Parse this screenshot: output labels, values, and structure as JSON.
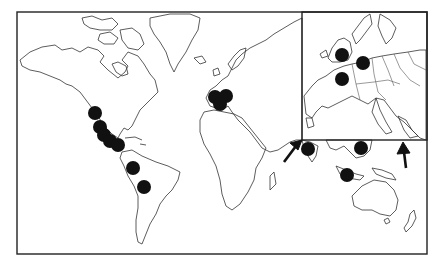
{
  "figure": {
    "type": "world-map-with-inset",
    "colors": {
      "background": "#ffffff",
      "outline": "#333333",
      "markers": "#111111"
    }
  },
  "main_map": {
    "markers": [
      {
        "region": "Mexico (northwest)",
        "x": 95,
        "y": 113
      },
      {
        "region": "Mexico (west)",
        "x": 100,
        "y": 127
      },
      {
        "region": "Mexico (central)",
        "x": 104,
        "y": 135
      },
      {
        "region": "Mexico (south)",
        "x": 110,
        "y": 141
      },
      {
        "region": "Central America",
        "x": 118,
        "y": 145
      },
      {
        "region": "Colombia/Ecuador",
        "x": 133,
        "y": 168
      },
      {
        "region": "Peru/Bolivia",
        "x": 144,
        "y": 187
      },
      {
        "region": "Iberia (north)",
        "x": 215,
        "y": 97
      },
      {
        "region": "Iberia (east)",
        "x": 226,
        "y": 96
      },
      {
        "region": "Iberia (south)",
        "x": 220,
        "y": 104
      },
      {
        "region": "India (south)",
        "x": 308,
        "y": 149
      },
      {
        "region": "Philippines/Vietnam",
        "x": 361,
        "y": 148
      },
      {
        "region": "Indonesia",
        "x": 347,
        "y": 175
      }
    ]
  },
  "inset": {
    "region": "Western & Central Europe",
    "bounds": {
      "x": 302,
      "y": 12,
      "width": 125,
      "height": 128
    },
    "markers": [
      {
        "region": "England (south)",
        "x": 342,
        "y": 55
      },
      {
        "region": "Germany (west)",
        "x": 363,
        "y": 63
      },
      {
        "region": "France (north)",
        "x": 342,
        "y": 79
      }
    ]
  },
  "arrows": [
    {
      "name": "arrow-to-inset-left",
      "from": [
        285,
        160
      ],
      "to": [
        300,
        140
      ]
    },
    {
      "name": "arrow-to-inset-bottom",
      "from": [
        405,
        168
      ],
      "to": [
        405,
        145
      ]
    }
  ]
}
